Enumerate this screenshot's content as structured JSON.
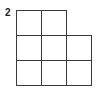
{
  "figure": {
    "label": "2",
    "grid": {
      "cell_size_px": 26,
      "origin_px": [
        16,
        10
      ],
      "line_color": "#3a3a3a",
      "rows": [
        [
          1,
          1,
          0
        ],
        [
          1,
          1,
          1
        ],
        [
          1,
          1,
          1
        ]
      ],
      "cell_count": 8
    }
  }
}
